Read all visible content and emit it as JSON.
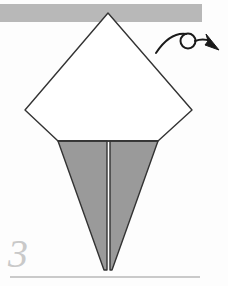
{
  "page": {
    "kind": "origami-instruction-step",
    "background_color": "#fdfdfd",
    "width": 228,
    "height": 286
  },
  "step": {
    "number": "3",
    "number_color": "#c9c9c9"
  },
  "colors": {
    "paper_front": "#ffffff",
    "paper_back": "#9a9a9a",
    "outline": "#333333",
    "top_bar": "#b8b8b8",
    "baseline_rule": "#b9b9b9",
    "arrow": "#1a1a1a"
  },
  "figure": {
    "name": "kite-base-with-folded-point",
    "top_bar": {
      "label": "top-edge-band",
      "x": 0,
      "y": 4,
      "width": 202,
      "height": 18,
      "color": "#b8b8b8"
    },
    "diamond": {
      "label": "white-kite-diamond",
      "fill": "#ffffff",
      "points": "108,13 192,110 158,141 58,141 25,110"
    },
    "lower_point": {
      "label": "gray-narrow-triangle",
      "fill": "#9a9a9a",
      "left_half": "58,141 107,141 107,270 104,270",
      "right_half": "110,141 158,141 112,270 110,270"
    },
    "center_crease": {
      "label": "vertical-center-crease",
      "x": 108,
      "y_top": 141,
      "y_bottom": 270
    },
    "baseline": {
      "label": "bottom-rule",
      "x1": 10,
      "x2": 200,
      "y": 277
    }
  },
  "arrow": {
    "name": "turn-over-arrow",
    "description": "curved arc with looped circle and solid arrowhead pointing down-right",
    "arc_path": "M 156,53 Q 170,32 186,34",
    "loop": {
      "cx": 188,
      "cy": 41,
      "rx": 7.5,
      "ry": 7.5
    },
    "tail_path": "M 195,41 Q 203,38 210,41",
    "head_points": "206,34 219,50 205,45 208,41",
    "color": "#1a1a1a"
  }
}
